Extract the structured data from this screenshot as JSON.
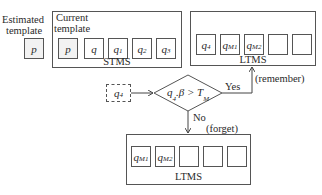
{
  "estimated_template": {
    "label_line1": "Estimated",
    "label_line2": "template",
    "cell": "p"
  },
  "stms": {
    "label_line1": "Current",
    "label_line2": "template",
    "caption": "STMS",
    "cells": [
      {
        "base": "p",
        "sub": ""
      },
      {
        "base": "q",
        "sub": ""
      },
      {
        "base": "q",
        "sub": "1"
      },
      {
        "base": "q",
        "sub": "2"
      },
      {
        "base": "q",
        "sub": "3"
      }
    ]
  },
  "ltms_top": {
    "caption": "LTMS",
    "cells": [
      {
        "base": "q",
        "sub": "4"
      },
      {
        "base": "q",
        "sub": "M1"
      },
      {
        "base": "q",
        "sub": "M2"
      },
      {
        "base": "",
        "sub": ""
      },
      {
        "base": "",
        "sub": ""
      }
    ]
  },
  "input_node": {
    "base": "q",
    "sub": "4"
  },
  "decision": {
    "condition_base": "q",
    "condition_sub": "4",
    "condition_mid": ".β > T",
    "condition_sub2": "M"
  },
  "yes_branch": {
    "label": "Yes",
    "note": "(remember)"
  },
  "no_branch": {
    "label": "No",
    "note": "(forget)"
  },
  "ltms_bottom": {
    "caption": "LTMS",
    "cells": [
      {
        "base": "q",
        "sub": "M1"
      },
      {
        "base": "q",
        "sub": "M2"
      },
      {
        "base": "",
        "sub": ""
      },
      {
        "base": "",
        "sub": ""
      },
      {
        "base": "",
        "sub": ""
      }
    ]
  }
}
